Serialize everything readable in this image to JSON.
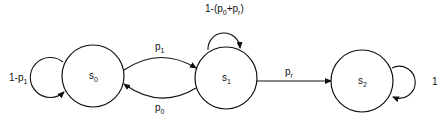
{
  "diagram": {
    "type": "state-transition",
    "nodes": [
      {
        "id": "s0",
        "label": "s",
        "sub": "0",
        "cx": 93,
        "cy": 76,
        "r": 31
      },
      {
        "id": "s1",
        "label": "s",
        "sub": "1",
        "cx": 226,
        "cy": 78,
        "r": 31
      },
      {
        "id": "s2",
        "label": "s",
        "sub": "2",
        "cx": 362,
        "cy": 81,
        "r": 31
      }
    ],
    "edges": [
      {
        "from": "s0",
        "to": "s0",
        "label": "1-p",
        "label_sub": "1",
        "suffix": ""
      },
      {
        "from": "s0",
        "to": "s1",
        "label": "p",
        "label_sub": "1",
        "suffix": ""
      },
      {
        "from": "s1",
        "to": "s0",
        "label": "p",
        "label_sub": "0",
        "suffix": ""
      },
      {
        "from": "s1",
        "to": "s1",
        "label": "1-(p",
        "label_sub": "0",
        "mid": "+p",
        "mid_sub": "r",
        "suffix": ")"
      },
      {
        "from": "s1",
        "to": "s2",
        "label": "p",
        "label_sub": "r",
        "suffix": ""
      },
      {
        "from": "s2",
        "to": "s2",
        "label": "1",
        "label_sub": "",
        "suffix": ""
      }
    ]
  }
}
